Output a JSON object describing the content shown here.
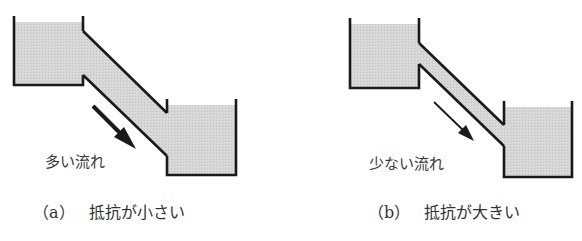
{
  "colors": {
    "water": "#d4d4d4",
    "outline": "#1a1a1a",
    "text": "#333333",
    "background": "#ffffff"
  },
  "panels": [
    {
      "id": "a",
      "flow_label": "多い流れ",
      "caption_tag": "（a）",
      "caption_text": "抵抗が小さい",
      "pipe": "wide",
      "arrow": "bold"
    },
    {
      "id": "b",
      "flow_label": "少ない流れ",
      "caption_tag": "（b）",
      "caption_text": "抵抗が大きい",
      "pipe": "narrow",
      "arrow": "thin"
    }
  ]
}
